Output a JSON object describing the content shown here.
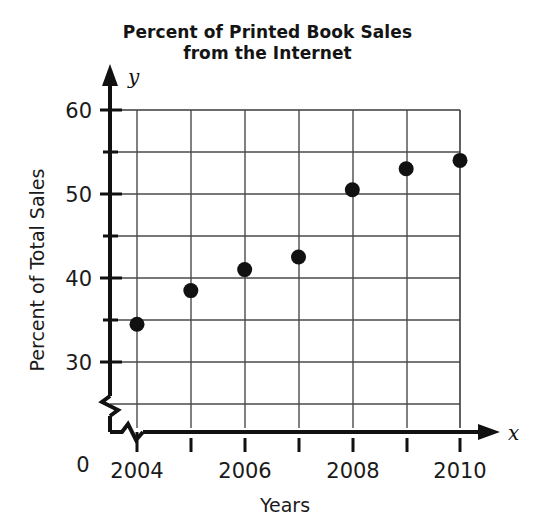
{
  "chart_data": {
    "type": "scatter",
    "title": "Percent of Printed Book Sales from the Internet",
    "title_lines": [
      "Percent of Printed Book Sales",
      "from the Internet"
    ],
    "xlabel": "Years",
    "ylabel": "Percent of Total Sales",
    "x_axis_variable": "x",
    "y_axis_variable": "y",
    "origin_label": "0",
    "x": [
      2004,
      2005,
      2006,
      2007,
      2008,
      2009,
      2010
    ],
    "values": [
      34.5,
      38.5,
      41,
      42.5,
      50.5,
      53,
      54
    ],
    "points": [
      {
        "x": 2004,
        "y": 34.5
      },
      {
        "x": 2005,
        "y": 38.5
      },
      {
        "x": 2006,
        "y": 41
      },
      {
        "x": 2007,
        "y": 42.5
      },
      {
        "x": 2008,
        "y": 50.5
      },
      {
        "x": 2009,
        "y": 53
      },
      {
        "x": 2010,
        "y": 54
      }
    ],
    "xlim": [
      2003.5,
      2010.5
    ],
    "ylim": [
      27.5,
      60
    ],
    "xticks": [
      2004,
      2005,
      2006,
      2007,
      2008,
      2009,
      2010
    ],
    "xtick_labels": [
      "2004",
      "",
      "2006",
      "",
      "2008",
      "",
      "2010"
    ],
    "yticks": [
      30,
      35,
      40,
      45,
      50,
      55,
      60
    ],
    "ytick_labels": [
      "30",
      "",
      "40",
      "",
      "50",
      "",
      "60"
    ],
    "grid": true,
    "axis_break_y": true,
    "legend": null,
    "marker": "filled-circle",
    "marker_color": "#111111",
    "grid_color": "#4a4a4a"
  }
}
